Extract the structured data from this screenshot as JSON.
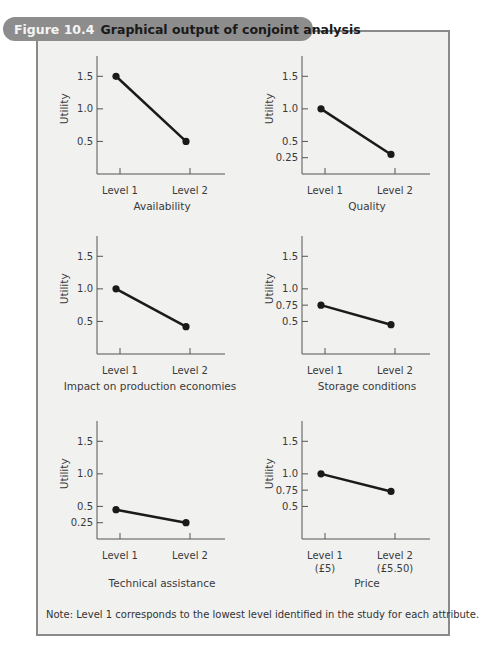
{
  "figure": {
    "number": "Figure 10.4",
    "title": "Graphical output of conjoint analysis",
    "note": "Note:  Level 1 corresponds to the lowest level identified in the study for each attribute."
  },
  "colors": {
    "banner": "#8d8d8d",
    "box_background": "#f1f1f0",
    "box_border": "#8a8a8a",
    "line": "#1a1a1a"
  },
  "chart_data": [
    {
      "type": "line",
      "title": "Availability",
      "ylabel": "Utility",
      "xlabel": "Availability",
      "categories": [
        "Level 1",
        "Level 2"
      ],
      "values": [
        1.5,
        0.5
      ],
      "yticks": [
        "1.5",
        "1.0",
        "0.5"
      ],
      "ytick_values": [
        1.5,
        1.0,
        0.5
      ],
      "ylim": [
        0,
        1.75
      ]
    },
    {
      "type": "line",
      "title": "Quality",
      "ylabel": "Utility",
      "xlabel": "Quality",
      "categories": [
        "Level 1",
        "Level 2"
      ],
      "values": [
        1.0,
        0.3
      ],
      "yticks": [
        "1.5",
        "1.0",
        "0.5",
        "0.25"
      ],
      "ytick_values": [
        1.5,
        1.0,
        0.5,
        0.25
      ],
      "ylim": [
        0,
        1.75
      ]
    },
    {
      "type": "line",
      "title": "Impact on production economies",
      "ylabel": "Utility",
      "xlabel": "Impact on production economies",
      "categories": [
        "Level 1",
        "Level 2"
      ],
      "values": [
        1.0,
        0.42
      ],
      "yticks": [
        "1.5",
        "1.0",
        "0.5"
      ],
      "ytick_values": [
        1.5,
        1.0,
        0.5
      ],
      "ylim": [
        0,
        1.75
      ]
    },
    {
      "type": "line",
      "title": "Storage conditions",
      "ylabel": "Utility",
      "xlabel": "Storage conditions",
      "categories": [
        "Level 1",
        "Level 2"
      ],
      "values": [
        0.75,
        0.45
      ],
      "yticks": [
        "1.5",
        "1.0",
        "0.75",
        "0.5"
      ],
      "ytick_values": [
        1.5,
        1.0,
        0.75,
        0.5
      ],
      "ylim": [
        0,
        1.75
      ]
    },
    {
      "type": "line",
      "title": "Technical assistance",
      "ylabel": "Utility",
      "xlabel": "Technical assistance",
      "categories": [
        "Level 1",
        "Level 2"
      ],
      "values": [
        0.45,
        0.25
      ],
      "yticks": [
        "1.5",
        "1.0",
        "0.5",
        "0.25"
      ],
      "ytick_values": [
        1.5,
        1.0,
        0.5,
        0.25
      ],
      "ylim": [
        0,
        1.75
      ]
    },
    {
      "type": "line",
      "title": "Price",
      "ylabel": "Utility",
      "xlabel": "Price",
      "categories": [
        "Level 1",
        "Level 2"
      ],
      "category_sublabels": [
        "(£5)",
        "(£5.50)"
      ],
      "values": [
        1.0,
        0.73
      ],
      "yticks": [
        "1.5",
        "1.0",
        "0.75",
        "0.5"
      ],
      "ytick_values": [
        1.5,
        1.0,
        0.75,
        0.5
      ],
      "ylim": [
        0,
        1.75
      ]
    }
  ]
}
